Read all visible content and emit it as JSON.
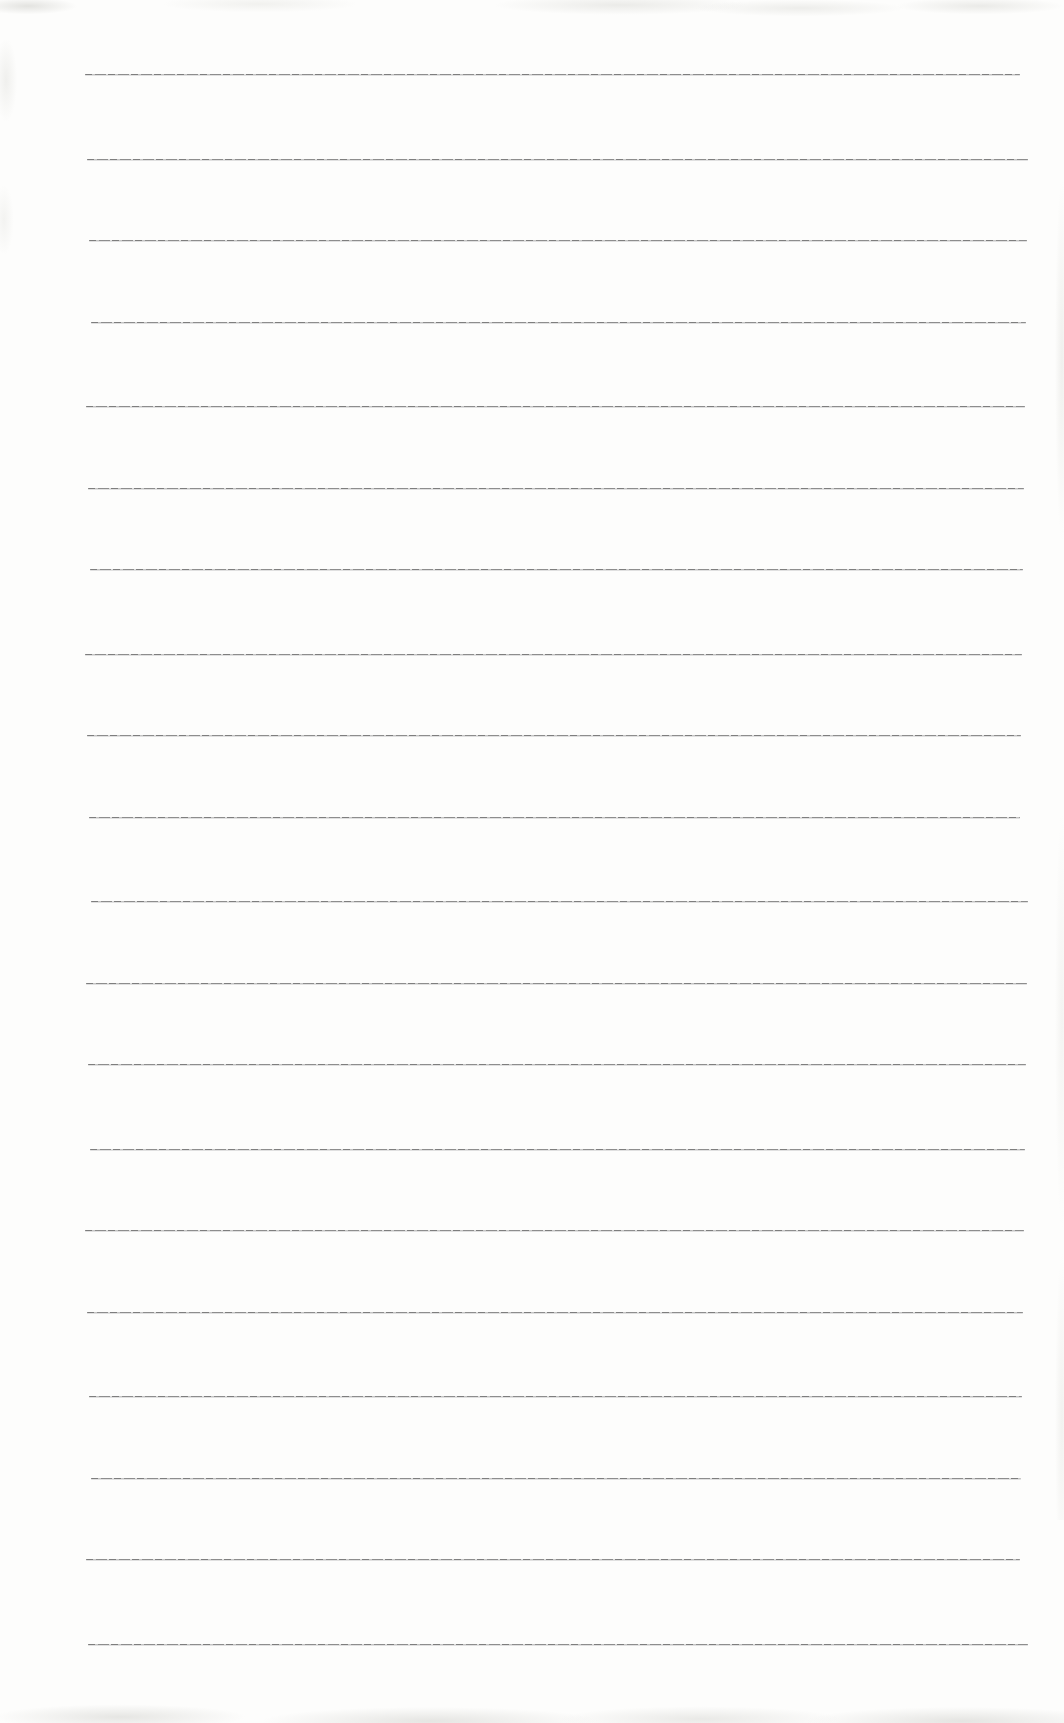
{
  "page": {
    "kind": "scanned-blank-ruled-notebook-page",
    "written_content": "",
    "paper_color": "#fdfdfc",
    "line_color": "#8e8e8e",
    "ruled_lines": {
      "count": 20,
      "first_top_px": 75,
      "spacing_px": 82.5,
      "left_px": 88,
      "right_px": 1024
    }
  }
}
